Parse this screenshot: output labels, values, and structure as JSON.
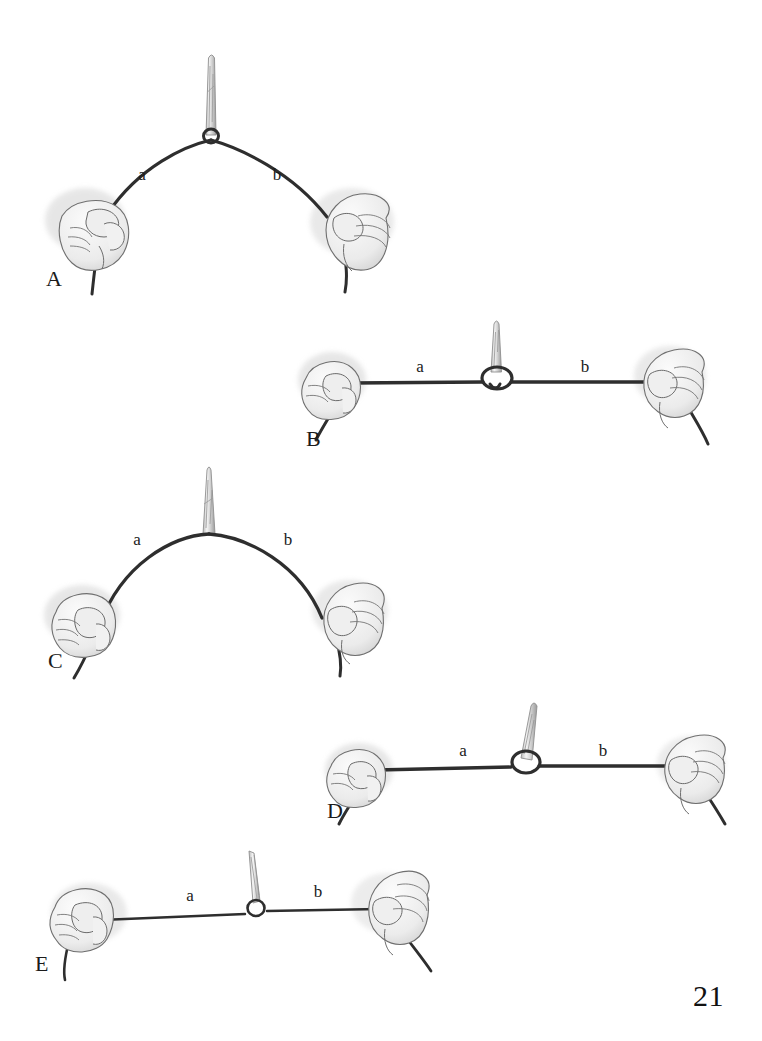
{
  "figure": {
    "page_number": "21",
    "style": "pencil sketch line drawing",
    "ink_color": "#2e2e2e",
    "skin_color": "#f2f2f2",
    "instrument_color": "#d9d9d9",
    "label_color": "#1b1b1b"
  },
  "panels": [
    {
      "id": "A",
      "letter": "A",
      "left_label": "a",
      "right_label": "b",
      "string_shape": "high-arch",
      "knot": "small-loop",
      "instrument": "needle-holder",
      "description": "Both strands arch upward to a small loop gripped by the needle holder"
    },
    {
      "id": "B",
      "letter": "B",
      "left_label": "a",
      "right_label": "b",
      "string_shape": "straight-horizontal",
      "knot": "wide-oval-loop",
      "instrument": "needle-holder",
      "description": "Strands pulled level with a wide open oval loop at the instrument"
    },
    {
      "id": "C",
      "letter": "C",
      "left_label": "a",
      "right_label": "b",
      "string_shape": "tall-arch",
      "knot": "none",
      "instrument": "needle-holder",
      "description": "Tall symmetric arch gripped directly by the instrument, no loop visible"
    },
    {
      "id": "D",
      "letter": "D",
      "left_label": "a",
      "right_label": "b",
      "string_shape": "straight-horizontal",
      "knot": "round-loop",
      "instrument": "needle-holder",
      "description": "Level strands with a round closed loop at the instrument tip"
    },
    {
      "id": "E",
      "letter": "E",
      "left_label": "a",
      "right_label": "b",
      "string_shape": "straight-horizontal-thin",
      "knot": "tight-small-loop",
      "instrument": "fine-forceps",
      "description": "Thin level strands with a tight small loop held by fine forceps"
    }
  ]
}
